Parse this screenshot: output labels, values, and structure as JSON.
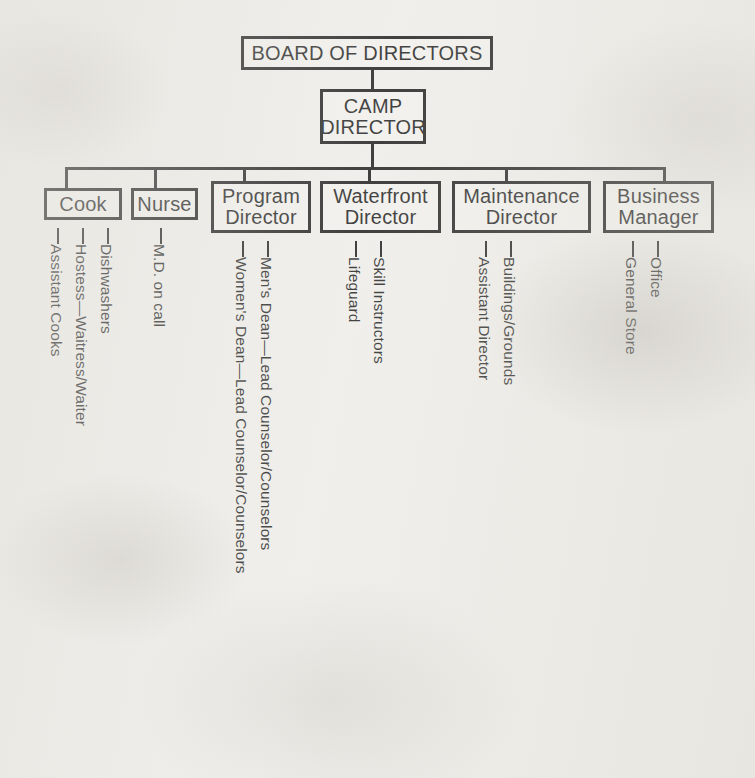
{
  "diagram": {
    "type": "organizational-chart",
    "title_box": "BOARD OF DIRECTORS",
    "second_box": "CAMP\nDIRECTOR",
    "second_box_line1": "CAMP",
    "second_box_line2": "DIRECTOR",
    "colors": {
      "ink": "#131313",
      "paper": "#efeeea"
    },
    "departments": [
      {
        "id": "cook",
        "label": "Cook",
        "label_lines": [
          "Cook"
        ],
        "reports": [
          "Assistant Cooks",
          "Hostess—Waitress/Waiter",
          "Dishwashers"
        ]
      },
      {
        "id": "nurse",
        "label": "Nurse",
        "label_lines": [
          "Nurse"
        ],
        "reports": [
          "M.D. on call"
        ]
      },
      {
        "id": "program-director",
        "label": "Program Director",
        "label_lines": [
          "Program",
          "Director"
        ],
        "reports": [
          "Women's Dean—Lead Counselor/Counselors",
          "Men's Dean—Lead Counselor/Counselors"
        ]
      },
      {
        "id": "waterfront-director",
        "label": "Waterfront Director",
        "label_lines": [
          "Waterfront",
          "Director"
        ],
        "reports": [
          "Lifeguard",
          "Skill Instructors"
        ]
      },
      {
        "id": "maintenance-director",
        "label": "Maintenance Director",
        "label_lines": [
          "Maintenance",
          "Director"
        ],
        "reports": [
          "Assistant Director",
          "Buildings/Grounds"
        ]
      },
      {
        "id": "business-manager",
        "label": "Business Manager",
        "label_lines": [
          "Business",
          "Manager"
        ],
        "reports": [
          "General Store",
          "Office"
        ]
      }
    ]
  }
}
